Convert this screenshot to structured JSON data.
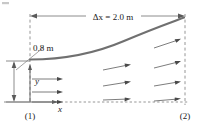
{
  "figure": {
    "labels": {
      "delta_x": "Δx = 2.0 m",
      "height": "0.8 m",
      "station_1": "(1)",
      "station_2": "(2)",
      "axis_x": "x",
      "axis_y": "y"
    },
    "colors": {
      "background": "#ffffff",
      "curve": "#707070",
      "line": "#808080",
      "dashed": "#8a8a8a",
      "text": "#1a1a1a",
      "vector": "#6e6e6e"
    },
    "geometry": {
      "station1_x": 30,
      "station2_x": 185,
      "baseline_y": 102,
      "curve_start_y": 59,
      "curve_end_y": 18,
      "dimension_line_y": 16
    },
    "icons": {
      "left_arrowhead": "arrow-left",
      "right_arrowhead": "arrow-right",
      "up_arrowhead": "arrow-up",
      "down_arrowhead": "arrow-down"
    },
    "vectors": {
      "left_row_count": 3,
      "right_row_count": 4,
      "description": "horizontal velocity arrows at station 1 growing and tilting upward toward station 2"
    }
  }
}
